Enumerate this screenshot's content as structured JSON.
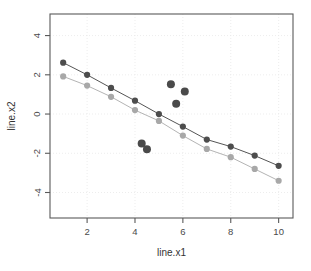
{
  "chart_data": {
    "type": "scatter",
    "title": "",
    "subtitle": "",
    "xlabel": "line.x1",
    "ylabel": "line.x2",
    "xlim": [
      0.45,
      10.6
    ],
    "ylim": [
      -5.3,
      5.1
    ],
    "xticks": [
      2,
      4,
      6,
      8,
      10
    ],
    "yticks": [
      4,
      2,
      0,
      -2,
      -4
    ],
    "xtick_labels": [
      "2",
      "4",
      "6",
      "8",
      "10"
    ],
    "ytick_labels": [
      "4",
      "2",
      "0",
      "-2",
      "-4"
    ],
    "grid": true,
    "grid_style": "dotted",
    "grid_color": "#e8e8e8",
    "frame": true,
    "frame_color": "#5a5a5a",
    "legend": null,
    "legend_position": "none",
    "series": [
      {
        "name": "fit-line-dark",
        "type": "line+markers",
        "color": "#555555",
        "marker_color": "#4d4d4d",
        "marker_size": 3.1,
        "line_width": 1.0,
        "x": [
          1,
          2,
          3,
          4,
          5,
          6,
          7,
          8,
          9,
          10
        ],
        "values": [
          2.62,
          2.0,
          1.33,
          0.68,
          0.0,
          -0.64,
          -1.3,
          -1.66,
          -2.12,
          -2.64
        ]
      },
      {
        "name": "fit-line-light",
        "type": "line+markers",
        "color": "#b4b4b4",
        "marker_color": "#a8a8a8",
        "marker_size": 3.1,
        "line_width": 1.0,
        "x": [
          1,
          2,
          3,
          4,
          5,
          6,
          7,
          8,
          9,
          10
        ],
        "values": [
          1.92,
          1.45,
          0.88,
          0.2,
          -0.35,
          -1.1,
          -1.78,
          -2.2,
          -2.8,
          -3.4
        ]
      },
      {
        "name": "outlier-points",
        "type": "scatter",
        "color": "#4a4a4a",
        "marker_size": 4.0,
        "points": [
          {
            "x": 5.5,
            "y": 1.52
          },
          {
            "x": 6.08,
            "y": 1.15
          },
          {
            "x": 5.72,
            "y": 0.52
          },
          {
            "x": 4.28,
            "y": -1.5
          },
          {
            "x": 4.5,
            "y": -1.8
          }
        ]
      }
    ],
    "annotations": []
  },
  "axes": {
    "x_title": "line.x1",
    "y_title": "line.x2"
  }
}
